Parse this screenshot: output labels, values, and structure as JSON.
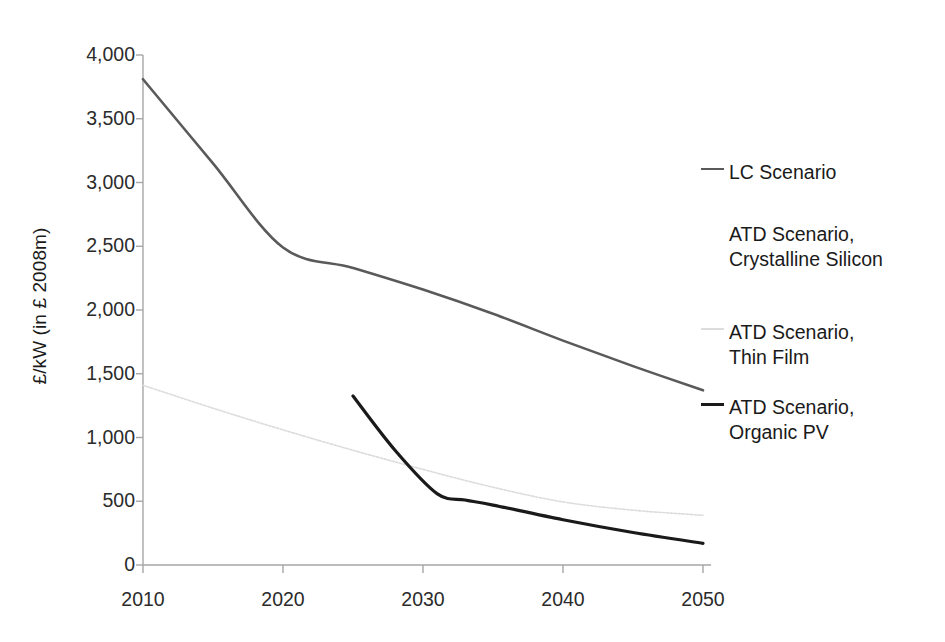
{
  "chart_data": {
    "type": "line",
    "title": "",
    "xlabel": "",
    "ylabel": "£/kW (in £ 2008m)",
    "xlim": [
      2010,
      2050
    ],
    "ylim": [
      0,
      4000
    ],
    "xticks": [
      "2010",
      "2020",
      "2030",
      "2040",
      "2050"
    ],
    "yticks": [
      "0",
      "500",
      "1,000",
      "1,500",
      "2,000",
      "2,500",
      "3,000",
      "3,500",
      "4,000"
    ],
    "grid": false,
    "legend_position": "right",
    "series": [
      {
        "name": "LC Scenario",
        "legend_label": "LC Scenario",
        "color": "#5a5a5a",
        "width": 2.6,
        "style": "solid",
        "x": [
          2010,
          2015,
          2020,
          2025,
          2030,
          2035,
          2040,
          2045,
          2050
        ],
        "values": [
          3810,
          3150,
          2490,
          2330,
          2160,
          1970,
          1760,
          1560,
          1370
        ]
      },
      {
        "name": "ATD Scenario, Crystalline Silicon",
        "legend_label": "ATD Scenario,\nCrystalline Silicon",
        "color": "#ffffff",
        "width": 1.5,
        "style": "solid",
        "x": [],
        "values": []
      },
      {
        "name": "ATD Scenario, Thin Film",
        "legend_label": "ATD Scenario,\nThin Film",
        "color": "#dcdcdc",
        "width": 1.6,
        "style": "dotted",
        "x": [
          2010,
          2015,
          2020,
          2025,
          2030,
          2035,
          2040,
          2045,
          2050
        ],
        "values": [
          1410,
          1230,
          1060,
          900,
          750,
          610,
          495,
          430,
          390
        ]
      },
      {
        "name": "ATD Scenario, Organic PV",
        "legend_label": "ATD Scenario,\nOrganic PV",
        "color": "#1a1a1a",
        "width": 3.2,
        "style": "solid",
        "x": [
          2025,
          2028,
          2031,
          2033,
          2035,
          2040,
          2045,
          2050
        ],
        "values": [
          1325,
          900,
          560,
          510,
          470,
          355,
          255,
          170
        ]
      }
    ]
  },
  "axes": {
    "y_axis_title": "£/kW (in £ 2008m)",
    "y_tick_labels": [
      "4,000",
      "3,500",
      "3,000",
      "2,500",
      "2,000",
      "1,500",
      "1,000",
      "500",
      "0"
    ],
    "x_tick_labels": [
      "2010",
      "2020",
      "2030",
      "2040",
      "2050"
    ]
  },
  "legend": {
    "items": [
      {
        "label": "LC Scenario",
        "color": "#5a5a5a",
        "style": "solid",
        "visible_swatch": true
      },
      {
        "label": "ATD Scenario,\nCrystalline Silicon",
        "color": "#ffffff",
        "style": "solid",
        "visible_swatch": false
      },
      {
        "label": "ATD Scenario,\nThin Film",
        "color": "#dcdcdc",
        "style": "solid",
        "visible_swatch": true
      },
      {
        "label": "ATD Scenario,\nOrganic PV",
        "color": "#1a1a1a",
        "style": "solid",
        "visible_swatch": true
      }
    ]
  }
}
